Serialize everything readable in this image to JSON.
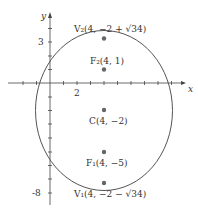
{
  "diagram": {
    "type": "ellipse-graph",
    "axes": {
      "x_label": "x",
      "y_label": "y",
      "tick_labels": {
        "x": [
          "2"
        ],
        "y": [
          "3",
          "-8"
        ]
      }
    },
    "ellipse": {
      "center": [
        4,
        -2
      ],
      "a_vertical": "√34",
      "b_horizontal": 5
    },
    "points": [
      {
        "id": "V2",
        "label": "V₂(4, −2 + √34)"
      },
      {
        "id": "F2",
        "label": "F₂(4, 1)"
      },
      {
        "id": "C",
        "label": "C(4, −2)"
      },
      {
        "id": "F1",
        "label": "F₁(4, −5)"
      },
      {
        "id": "V1",
        "label": "V₁(4, −2 − √34)"
      }
    ],
    "colors": {
      "curve": "#555555",
      "point": "#666666",
      "axis": "#444444"
    }
  }
}
